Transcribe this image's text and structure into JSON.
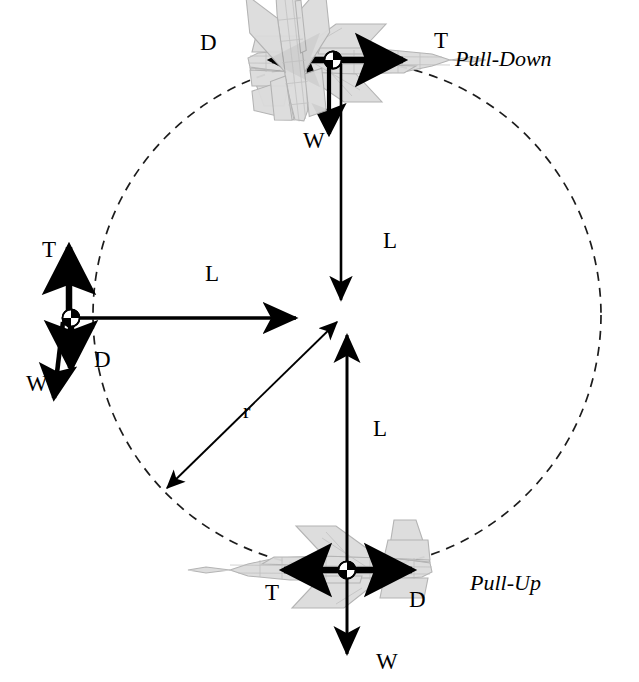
{
  "figure": {
    "background_color": "#ffffff",
    "stroke_color": "#000000",
    "aircraft_fill": "#d9d9d9",
    "aircraft_stroke": "#a8a8a8"
  },
  "loop": {
    "center_x": 347,
    "center_y": 315,
    "radius": 254,
    "dash_pattern": "9 7",
    "line_width": 1.6
  },
  "phases": [
    {
      "id": "pull-down",
      "label": "Pull-Down",
      "x": 455,
      "y": 48
    },
    {
      "id": "pull-up",
      "label": "Pull-Up",
      "x": 470,
      "y": 572
    }
  ],
  "aircraft": [
    {
      "id": "top-inverted",
      "position": "top",
      "attitude": "inverted, nose right",
      "cg_x": 333,
      "cg_y": 60,
      "forces": [
        {
          "symbol": "T",
          "name": "thrust",
          "direction": "right",
          "label_x": 434,
          "label_y": 29
        },
        {
          "symbol": "D",
          "name": "drag",
          "direction": "left",
          "label_x": 200,
          "label_y": 31
        },
        {
          "symbol": "W",
          "name": "weight",
          "direction": "down",
          "label_x": 303,
          "label_y": 129
        },
        {
          "symbol": "L",
          "name": "lift",
          "direction": "down",
          "label_x": 383,
          "label_y": 229
        }
      ]
    },
    {
      "id": "left-vertical",
      "position": "left",
      "attitude": "vertical, nose up",
      "cg_x": 71,
      "cg_y": 318,
      "forces": [
        {
          "symbol": "T",
          "name": "thrust",
          "direction": "up",
          "label_x": 42,
          "label_y": 238
        },
        {
          "symbol": "D",
          "name": "drag",
          "direction": "down",
          "label_x": 94,
          "label_y": 348
        },
        {
          "symbol": "W",
          "name": "weight",
          "direction": "down",
          "label_x": 26,
          "label_y": 372
        },
        {
          "symbol": "L",
          "name": "lift",
          "direction": "right",
          "label_x": 205,
          "label_y": 262
        }
      ]
    },
    {
      "id": "bottom-upright",
      "position": "bottom",
      "attitude": "upright, nose left",
      "cg_x": 347,
      "cg_y": 570,
      "forces": [
        {
          "symbol": "T",
          "name": "thrust",
          "direction": "left",
          "label_x": 265,
          "label_y": 581
        },
        {
          "symbol": "D",
          "name": "drag",
          "direction": "right",
          "label_x": 409,
          "label_y": 588
        },
        {
          "symbol": "W",
          "name": "weight",
          "direction": "down",
          "label_x": 376,
          "label_y": 650
        },
        {
          "symbol": "L",
          "name": "lift",
          "direction": "up",
          "label_x": 373,
          "label_y": 417
        }
      ]
    }
  ],
  "radius_annotation": {
    "symbol": "r",
    "name": "loop-radius",
    "label_x": 243,
    "label_y": 400,
    "from_x": 167,
    "from_y": 488,
    "to_x": 337,
    "to_y": 322,
    "double_headed": true
  }
}
